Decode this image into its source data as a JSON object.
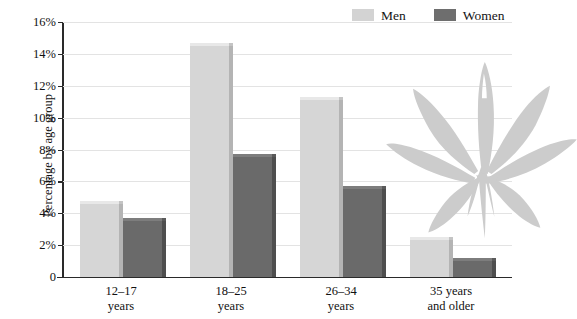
{
  "chart_data": {
    "type": "bar",
    "title": "",
    "subtitle": "",
    "xlabel": "",
    "ylabel": "Percentage by age group",
    "categories": [
      "12–17 years",
      "18–25 years",
      "26–34 years",
      "35 years and older"
    ],
    "category_lines": [
      [
        "12–17",
        "years"
      ],
      [
        "18–25",
        "years"
      ],
      [
        "26–34",
        "years"
      ],
      [
        "35 years",
        "and older"
      ]
    ],
    "series": [
      {
        "name": "Men",
        "color": "#d6d6d6",
        "values": [
          4.6,
          14.5,
          11.1,
          2.3
        ]
      },
      {
        "name": "Women",
        "color": "#6a6a6a",
        "values": [
          3.5,
          7.5,
          5.5,
          1.0
        ]
      }
    ],
    "ylim": [
      0,
      16
    ],
    "ytick_values": [
      0,
      2,
      4,
      6,
      8,
      10,
      12,
      14,
      16
    ],
    "ytick_labels": [
      "0",
      "2%",
      "4%",
      "6%",
      "8%",
      "10%",
      "12%",
      "14%",
      "16%"
    ],
    "grid": true,
    "grid_axis": "y",
    "legend_position": "top-right",
    "annotations": [
      {
        "name": "cannabis-leaf-watermark",
        "type": "image",
        "description": "gray cannabis leaf silhouette"
      }
    ]
  },
  "legend": {
    "entries": [
      {
        "label": "Men",
        "swatch": "men"
      },
      {
        "label": "Women",
        "swatch": "women"
      }
    ]
  },
  "axes": {
    "y_title": "Percentage by age group"
  }
}
